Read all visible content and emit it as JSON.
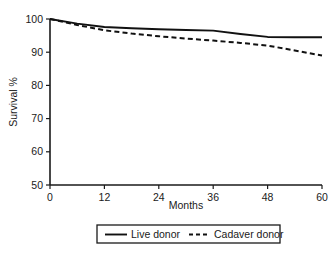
{
  "chart_data": {
    "type": "line",
    "title": "",
    "xlabel": "Months",
    "ylabel": "Survival %",
    "xlim": [
      0,
      60
    ],
    "ylim": [
      50,
      100
    ],
    "grid": false,
    "legend_position": "bottom",
    "xticks": [
      "0",
      "12",
      "24",
      "36",
      "48",
      "60"
    ],
    "xtick_values": [
      0,
      12,
      24,
      36,
      48,
      60
    ],
    "yticks": [
      "50",
      "60",
      "70",
      "80",
      "90",
      "100"
    ],
    "ytick_values": [
      50,
      60,
      70,
      80,
      90,
      100
    ],
    "x": [
      0,
      6,
      12,
      18,
      24,
      30,
      36,
      42,
      48,
      54,
      60
    ],
    "series": [
      {
        "name": "Live donor",
        "style": "solid",
        "values": [
          100,
          98.6,
          97.6,
          97.2,
          96.9,
          96.7,
          96.5,
          95.5,
          94.6,
          94.5,
          94.5
        ]
      },
      {
        "name": "Cadaver donor",
        "style": "dashed",
        "values": [
          100,
          98.2,
          96.6,
          95.6,
          94.8,
          94.1,
          93.5,
          92.8,
          92.0,
          90.5,
          89.0
        ]
      }
    ]
  },
  "axes": {
    "x_title": "Months",
    "y_title": "Survival %"
  },
  "legend": {
    "items": [
      {
        "label": "Live donor",
        "style": "solid"
      },
      {
        "label": "Cadaver donor",
        "style": "dashed"
      }
    ]
  },
  "colors": {
    "ink": "#111111",
    "axis": "#1a1a1a",
    "background": "#ffffff"
  }
}
